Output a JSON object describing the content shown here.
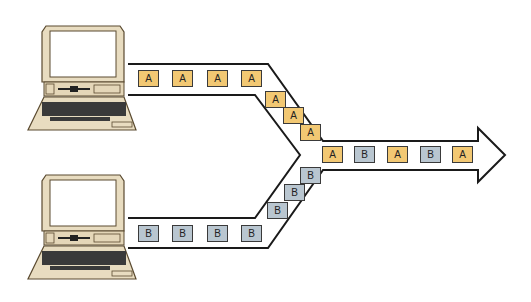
{
  "diagram": {
    "title": "",
    "colors": {
      "packet_a": "#f2c873",
      "packet_b": "#b9c6d0",
      "line": "#1a1a1a",
      "computer": "#e8dcc0"
    },
    "sources": [
      {
        "id": "computer-a",
        "label": ""
      },
      {
        "id": "computer-b",
        "label": ""
      }
    ],
    "packets": {
      "top_straight": [
        "A",
        "A",
        "A",
        "A"
      ],
      "top_diagonal": [
        "A",
        "A",
        "A"
      ],
      "bottom_straight": [
        "B",
        "B",
        "B",
        "B"
      ],
      "bottom_diagonal": [
        "B",
        "B",
        "B"
      ],
      "merged": [
        "A",
        "B",
        "A",
        "B",
        "A"
      ]
    }
  }
}
